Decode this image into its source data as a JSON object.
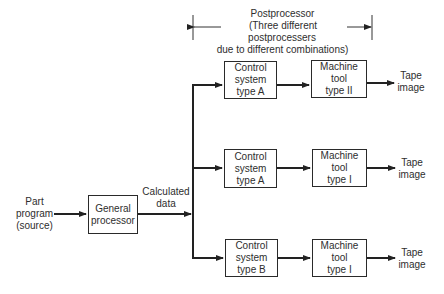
{
  "header": {
    "title": "Postprocessor",
    "subtitle_line1": "(Three different postprocessers",
    "subtitle_line2": "due to different combinations)"
  },
  "input": {
    "line1": "Part",
    "line2": "program",
    "line3": "(source)"
  },
  "general_processor": {
    "line1": "General",
    "line2": "processor"
  },
  "calculated_data": {
    "line1": "Calculated",
    "line2": "data"
  },
  "rows": [
    {
      "control": {
        "line1": "Control",
        "line2": "system",
        "line3": "type A"
      },
      "machine": {
        "line1": "Machine",
        "line2": "tool",
        "line3": "type II"
      },
      "output": {
        "line1": "Tape",
        "line2": "image"
      }
    },
    {
      "control": {
        "line1": "Control",
        "line2": "system",
        "line3": "type A"
      },
      "machine": {
        "line1": "Machine",
        "line2": "tool",
        "line3": "type I"
      },
      "output": {
        "line1": "Tape",
        "line2": "image"
      }
    },
    {
      "control": {
        "line1": "Control",
        "line2": "system",
        "line3": "type B"
      },
      "machine": {
        "line1": "Machine",
        "line2": "tool",
        "line3": "type I"
      },
      "output": {
        "line1": "Tape",
        "line2": "image"
      }
    }
  ]
}
